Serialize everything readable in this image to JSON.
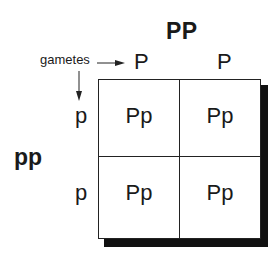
{
  "diagram": {
    "type": "punnett-square",
    "parent_top": "PP",
    "parent_left": "pp",
    "gametes_label": "gametes",
    "gametes_top": [
      "P",
      "P"
    ],
    "gametes_left": [
      "p",
      "p"
    ],
    "cells": [
      [
        "Pp",
        "Pp"
      ],
      [
        "Pp",
        "Pp"
      ]
    ]
  }
}
